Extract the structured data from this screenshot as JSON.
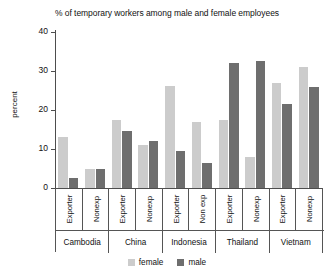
{
  "chart_data": {
    "type": "bar",
    "title": "% of temporary workers among male and female employees",
    "xlabel": "",
    "ylabel": "percent",
    "ylim": [
      0,
      40
    ],
    "yticks": [
      0,
      10,
      20,
      30,
      40
    ],
    "grid": false,
    "legend_position": "bottom-center",
    "groups": [
      {
        "country": "Cambodia",
        "subcategory": "Exporter"
      },
      {
        "country": "Cambodia",
        "subcategory": "Nonexp"
      },
      {
        "country": "China",
        "subcategory": "Exporter"
      },
      {
        "country": "China",
        "subcategory": "Nonexp"
      },
      {
        "country": "Indonesia",
        "subcategory": "Exporter"
      },
      {
        "country": "Indonesia",
        "subcategory": "Non exp"
      },
      {
        "country": "Thailand",
        "subcategory": "Exporter"
      },
      {
        "country": "Thailand",
        "subcategory": "Nonexp"
      },
      {
        "country": "Vietnam",
        "subcategory": "Exporter"
      },
      {
        "country": "Vietnam",
        "subcategory": "Nonexp"
      }
    ],
    "categories": [
      "Cambodia Exporter",
      "Cambodia Nonexp",
      "China Exporter",
      "China Nonexp",
      "Indonesia Exporter",
      "Indonesia Non exp",
      "Thailand Exporter",
      "Thailand Nonexp",
      "Vietnam Exporter",
      "Vietnam Nonexp"
    ],
    "series": [
      {
        "name": "female",
        "color": "#cccccc",
        "values": [
          13.0,
          4.8,
          17.5,
          11.0,
          26.2,
          17.0,
          17.5,
          8.0,
          27.0,
          31.0
        ]
      },
      {
        "name": "male",
        "color": "#6e6e6e",
        "values": [
          2.6,
          5.0,
          14.5,
          12.0,
          9.5,
          6.5,
          32.0,
          32.5,
          21.5,
          26.0
        ]
      }
    ],
    "countries": [
      "Cambodia",
      "China",
      "Indonesia",
      "Thailand",
      "Vietnam"
    ]
  },
  "legend": {
    "items": [
      {
        "label": "female",
        "color": "#cccccc"
      },
      {
        "label": "male",
        "color": "#6e6e6e"
      }
    ]
  }
}
